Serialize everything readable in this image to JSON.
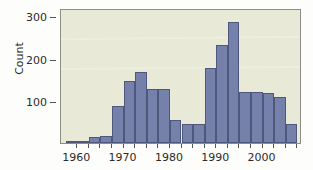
{
  "chart_data": {
    "type": "bar",
    "title": "",
    "subtitle": "",
    "xlabel": "",
    "ylabel": "Count",
    "xlim": [
      1956.5,
      2008.5
    ],
    "ylim": [
      0,
      320
    ],
    "grid": false,
    "legend": null,
    "bin_width": 2.5,
    "series_name": "Count",
    "bar_color": "#7581ab",
    "bar_edge_color": "#4f587c",
    "plot_background": "#e9e9d8",
    "y_ticks": [
      {
        "value": 100,
        "label": "100"
      },
      {
        "value": 200,
        "label": "200"
      },
      {
        "value": 300,
        "label": "300"
      }
    ],
    "x_ticks": [
      {
        "value": 1960,
        "label": "1960"
      },
      {
        "value": 1962.5,
        "label": ""
      },
      {
        "value": 1965,
        "label": ""
      },
      {
        "value": 1967.5,
        "label": ""
      },
      {
        "value": 1970,
        "label": "1970"
      },
      {
        "value": 1972.5,
        "label": ""
      },
      {
        "value": 1975,
        "label": ""
      },
      {
        "value": 1977.5,
        "label": ""
      },
      {
        "value": 1980,
        "label": "1980"
      },
      {
        "value": 1982.5,
        "label": ""
      },
      {
        "value": 1985,
        "label": ""
      },
      {
        "value": 1987.5,
        "label": ""
      },
      {
        "value": 1990,
        "label": "1990"
      },
      {
        "value": 1992.5,
        "label": ""
      },
      {
        "value": 1995,
        "label": ""
      },
      {
        "value": 1997.5,
        "label": ""
      },
      {
        "value": 2000,
        "label": "2000"
      },
      {
        "value": 2002.5,
        "label": ""
      },
      {
        "value": 2005,
        "label": ""
      },
      {
        "value": 2007.5,
        "label": ""
      }
    ],
    "x_tick_labels_visible": [
      "1960",
      "1970",
      "1980",
      "1990",
      "2000"
    ],
    "categories": [
      "1957.5",
      "1960.0",
      "1962.5",
      "1965.0",
      "1967.5",
      "1970.0",
      "1972.5",
      "1975.0",
      "1977.5",
      "1980.0",
      "1982.5",
      "1985.0",
      "1987.5",
      "1990.0",
      "1992.5",
      "1995.0",
      "1997.5",
      "2000.0",
      "2002.5",
      "2005.0"
    ],
    "bins": [
      {
        "x_start": 1957.5,
        "x_end": 1960.0,
        "value": 3
      },
      {
        "x_start": 1960.0,
        "x_end": 1962.5,
        "value": 5
      },
      {
        "x_start": 1962.5,
        "x_end": 1965.0,
        "value": 15
      },
      {
        "x_start": 1965.0,
        "x_end": 1967.5,
        "value": 16
      },
      {
        "x_start": 1967.5,
        "x_end": 1970.0,
        "value": 88
      },
      {
        "x_start": 1970.0,
        "x_end": 1972.5,
        "value": 147
      },
      {
        "x_start": 1972.5,
        "x_end": 1975.0,
        "value": 168
      },
      {
        "x_start": 1975.0,
        "x_end": 1977.5,
        "value": 129
      },
      {
        "x_start": 1977.5,
        "x_end": 1980.0,
        "value": 129
      },
      {
        "x_start": 1980.0,
        "x_end": 1982.5,
        "value": 54
      },
      {
        "x_start": 1982.5,
        "x_end": 1985.0,
        "value": 45
      },
      {
        "x_start": 1985.0,
        "x_end": 1987.5,
        "value": 45
      },
      {
        "x_start": 1987.5,
        "x_end": 1990.0,
        "value": 177
      },
      {
        "x_start": 1990.0,
        "x_end": 1992.5,
        "value": 233
      },
      {
        "x_start": 1992.5,
        "x_end": 1995.0,
        "value": 287
      },
      {
        "x_start": 1995.0,
        "x_end": 1997.5,
        "value": 120
      },
      {
        "x_start": 1997.5,
        "x_end": 2000.0,
        "value": 120
      },
      {
        "x_start": 2000.0,
        "x_end": 2002.5,
        "value": 119
      },
      {
        "x_start": 2002.5,
        "x_end": 2005.0,
        "value": 108
      },
      {
        "x_start": 2005.0,
        "x_end": 2007.5,
        "value": 44
      }
    ],
    "values": [
      3,
      5,
      15,
      16,
      88,
      147,
      168,
      129,
      129,
      54,
      45,
      45,
      177,
      233,
      287,
      120,
      120,
      119,
      108,
      44
    ]
  }
}
